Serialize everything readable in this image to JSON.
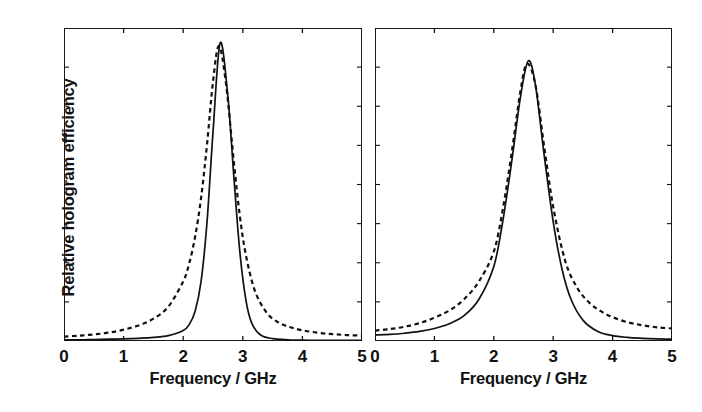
{
  "figure": {
    "ylabel": "Relative hologram efficiency",
    "xlabel": "Frequency / GHz",
    "line_color": "#111111",
    "background": "#ffffff"
  },
  "panels": [
    {
      "id": "left",
      "xticklabels": [
        "0",
        "1",
        "2",
        "3",
        "4",
        "5"
      ],
      "xlabel": "Frequency / GHz"
    },
    {
      "id": "right",
      "xticklabels": [
        "0",
        "1",
        "2",
        "3",
        "4",
        "5"
      ],
      "xlabel": "Frequency / GHz"
    }
  ],
  "chart_data": {
    "type": "line",
    "title": "",
    "xlabel": "Frequency / GHz",
    "ylabel": "Relative hologram efficiency",
    "xlim": [
      0,
      5
    ],
    "ylim": [
      0,
      1.05
    ],
    "grid": false,
    "legend": null,
    "xticks": [
      0,
      1,
      2,
      3,
      4,
      5
    ],
    "yticks": [],
    "panels": [
      {
        "name": "left-panel",
        "series": [
          {
            "name": "solid-curve",
            "style": "solid",
            "center": 2.62,
            "peak": 1.0,
            "fwhm": 0.56,
            "shape": "narrow-gaussian-like",
            "x": [
              0.0,
              0.25,
              0.5,
              0.75,
              1.0,
              1.25,
              1.5,
              1.75,
              2.0,
              2.1,
              2.2,
              2.3,
              2.4,
              2.5,
              2.62,
              2.75,
              2.85,
              2.95,
              3.05,
              3.15,
              3.3,
              3.5,
              3.75,
              4.0,
              4.25,
              4.5,
              4.75,
              5.0
            ],
            "y": [
              0.004,
              0.004,
              0.005,
              0.006,
              0.007,
              0.009,
              0.012,
              0.018,
              0.035,
              0.055,
              0.1,
              0.2,
              0.4,
              0.7,
              1.0,
              0.82,
              0.55,
              0.3,
              0.14,
              0.06,
              0.02,
              0.008,
              0.004,
              0.003,
              0.002,
              0.002,
              0.002,
              0.002
            ]
          },
          {
            "name": "dashed-curve",
            "style": "dashed",
            "center": 2.6,
            "peak": 0.99,
            "fwhm": 0.62,
            "shape": "lorentzian-broad-tails",
            "x": [
              0.0,
              0.25,
              0.5,
              0.75,
              1.0,
              1.25,
              1.5,
              1.75,
              2.0,
              2.1,
              2.2,
              2.3,
              2.4,
              2.5,
              2.6,
              2.72,
              2.85,
              2.95,
              3.05,
              3.2,
              3.4,
              3.6,
              3.8,
              4.0,
              4.25,
              4.5,
              4.75,
              5.0
            ],
            "y": [
              0.015,
              0.018,
              0.022,
              0.028,
              0.038,
              0.052,
              0.075,
              0.115,
              0.2,
              0.26,
              0.35,
              0.48,
              0.66,
              0.87,
              0.99,
              0.86,
              0.6,
              0.42,
              0.29,
              0.17,
              0.095,
              0.062,
              0.046,
              0.036,
              0.028,
              0.023,
              0.02,
              0.018
            ]
          }
        ]
      },
      {
        "name": "right-panel",
        "series": [
          {
            "name": "solid-curve",
            "style": "solid",
            "center": 2.58,
            "peak": 0.94,
            "fwhm": 0.78,
            "shape": "broad-peak-moderate-tails",
            "x": [
              0.0,
              0.25,
              0.5,
              0.75,
              1.0,
              1.25,
              1.5,
              1.75,
              2.0,
              2.15,
              2.3,
              2.45,
              2.58,
              2.7,
              2.85,
              3.0,
              3.15,
              3.3,
              3.5,
              3.75,
              4.0,
              4.25,
              4.5,
              4.75,
              5.0
            ],
            "y": [
              0.02,
              0.022,
              0.026,
              0.032,
              0.042,
              0.058,
              0.085,
              0.14,
              0.25,
              0.4,
              0.6,
              0.82,
              0.94,
              0.86,
              0.62,
              0.4,
              0.24,
              0.14,
              0.07,
              0.032,
              0.018,
              0.012,
              0.009,
              0.007,
              0.006
            ]
          },
          {
            "name": "dashed-curve",
            "style": "dashed",
            "center": 2.56,
            "peak": 0.93,
            "fwhm": 0.8,
            "shape": "lorentzian-broad-tails",
            "x": [
              0.0,
              0.25,
              0.5,
              0.75,
              1.0,
              1.25,
              1.5,
              1.75,
              2.0,
              2.15,
              2.3,
              2.45,
              2.56,
              2.7,
              2.85,
              3.0,
              3.2,
              3.4,
              3.6,
              3.8,
              4.0,
              4.25,
              4.5,
              4.75,
              5.0
            ],
            "y": [
              0.035,
              0.04,
              0.048,
              0.06,
              0.078,
              0.102,
              0.14,
              0.2,
              0.3,
              0.44,
              0.63,
              0.84,
              0.93,
              0.86,
              0.65,
              0.45,
              0.27,
              0.18,
              0.13,
              0.1,
              0.08,
              0.063,
              0.053,
              0.046,
              0.042
            ]
          }
        ]
      }
    ]
  }
}
